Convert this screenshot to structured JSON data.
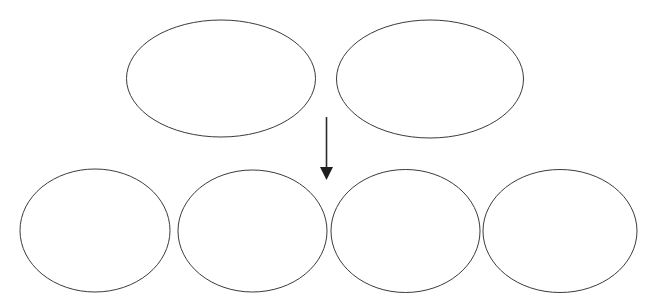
{
  "figure": {
    "title": "",
    "background_color": "#ffffff",
    "stroke_color": "#3b3b3b",
    "arrow_color": "#1e1e1e",
    "width": 656,
    "height": 305
  },
  "top_row": {
    "label": "",
    "count": 2,
    "shapes": [
      {
        "name": "top-cell-1",
        "label": "",
        "cx": 221,
        "cy": 78.5,
        "rx": 94.5,
        "ry": 58.5
      },
      {
        "name": "top-cell-2",
        "label": "",
        "cx": 430,
        "cy": 79,
        "rx": 93.5,
        "ry": 59
      }
    ]
  },
  "arrow": {
    "name": "downward-arrow",
    "label": "",
    "direction": "down",
    "x": 326.5,
    "y_start": 117,
    "y_end": 180,
    "shaft_end": 167,
    "head_width": 13,
    "head_height": 13
  },
  "bottom_row": {
    "label": "",
    "count": 4,
    "shapes": [
      {
        "name": "bottom-cell-1",
        "label": "",
        "cx": 95,
        "cy": 230.5,
        "rx": 75,
        "ry": 61.5
      },
      {
        "name": "bottom-cell-2",
        "label": "",
        "cx": 252.5,
        "cy": 231,
        "rx": 74.5,
        "ry": 61
      },
      {
        "name": "bottom-cell-3",
        "label": "",
        "cx": 405.5,
        "cy": 231,
        "rx": 74.5,
        "ry": 61.5
      },
      {
        "name": "bottom-cell-4",
        "label": "",
        "cx": 560,
        "cy": 231,
        "rx": 77,
        "ry": 61.5
      }
    ]
  }
}
